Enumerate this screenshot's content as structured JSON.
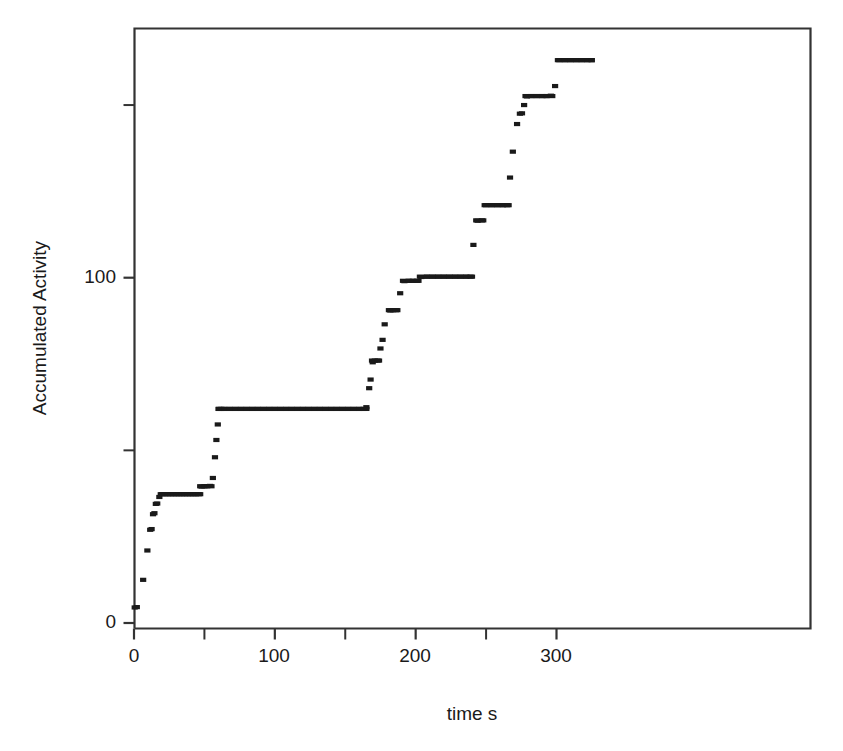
{
  "chart_data": {
    "type": "scatter",
    "title": "",
    "subtitle": "",
    "xlabel": "time s",
    "ylabel": "Accumulated Activity",
    "xlim": [
      -4,
      338
    ],
    "ylim": [
      -3,
      176
    ],
    "grid": false,
    "legend": null,
    "marker": "small filled square",
    "marker_color": "#1a1a1a",
    "xticks_major": [
      0,
      100,
      200,
      300
    ],
    "xticks_major_labels": [
      "0",
      "100",
      "200",
      "300"
    ],
    "xticks_minor": [
      50,
      150,
      250
    ],
    "yticks_major": [
      0,
      100
    ],
    "yticks_major_labels": [
      "0",
      "100"
    ],
    "yticks_minor": [
      50,
      150
    ],
    "points": [
      [
        0.5,
        4.5
      ],
      [
        2.0,
        4.6
      ],
      [
        6.5,
        12.5
      ],
      [
        9.5,
        21.0
      ],
      [
        11.5,
        27.0
      ],
      [
        12.5,
        27.2
      ],
      [
        13.5,
        31.5
      ],
      [
        14.5,
        31.8
      ],
      [
        15.5,
        34.5
      ],
      [
        16.5,
        34.6
      ],
      [
        18.0,
        36.5
      ],
      [
        20.0,
        37.3
      ],
      [
        22.0,
        37.3
      ],
      [
        24.0,
        37.3
      ],
      [
        26.0,
        37.3
      ],
      [
        28.0,
        37.3
      ],
      [
        30.0,
        37.3
      ],
      [
        32.0,
        37.3
      ],
      [
        34.0,
        37.3
      ],
      [
        36.0,
        37.3
      ],
      [
        38.0,
        37.3
      ],
      [
        40.0,
        37.3
      ],
      [
        42.0,
        37.3
      ],
      [
        44.0,
        37.3
      ],
      [
        46.0,
        37.3
      ],
      [
        48.0,
        39.5
      ],
      [
        50.0,
        39.6
      ],
      [
        52.0,
        39.6
      ],
      [
        54.0,
        39.7
      ],
      [
        56.0,
        42.0
      ],
      [
        57.5,
        48.0
      ],
      [
        58.5,
        53.0
      ],
      [
        59.5,
        57.5
      ],
      [
        60.5,
        62.0
      ],
      [
        62.0,
        62.0
      ],
      [
        64.0,
        62.0
      ],
      [
        68.0,
        62.0
      ],
      [
        72.0,
        62.0
      ],
      [
        76.0,
        62.0
      ],
      [
        80.0,
        62.0
      ],
      [
        84.0,
        62.0
      ],
      [
        88.0,
        62.0
      ],
      [
        92.0,
        62.0
      ],
      [
        96.0,
        62.0
      ],
      [
        100.0,
        62.0
      ],
      [
        104.0,
        62.0
      ],
      [
        108.0,
        62.0
      ],
      [
        112.0,
        62.0
      ],
      [
        116.0,
        62.0
      ],
      [
        120.0,
        62.0
      ],
      [
        124.0,
        62.0
      ],
      [
        128.0,
        62.0
      ],
      [
        132.0,
        62.0
      ],
      [
        136.0,
        62.0
      ],
      [
        140.0,
        62.0
      ],
      [
        144.0,
        62.0
      ],
      [
        148.0,
        62.0
      ],
      [
        152.0,
        62.0
      ],
      [
        156.0,
        62.0
      ],
      [
        160.0,
        62.0
      ],
      [
        163.0,
        62.0
      ],
      [
        165.0,
        62.5
      ],
      [
        167.0,
        68.0
      ],
      [
        168.0,
        70.5
      ],
      [
        169.5,
        75.5
      ],
      [
        171.0,
        76.0
      ],
      [
        173.0,
        76.0
      ],
      [
        175.0,
        79.5
      ],
      [
        176.5,
        82.0
      ],
      [
        178.0,
        86.5
      ],
      [
        182.0,
        90.5
      ],
      [
        184.0,
        90.6
      ],
      [
        186.0,
        90.6
      ],
      [
        189.0,
        95.5
      ],
      [
        192.0,
        99.0
      ],
      [
        195.0,
        99.1
      ],
      [
        198.0,
        99.1
      ],
      [
        201.0,
        99.1
      ],
      [
        204.0,
        100.2
      ],
      [
        208.0,
        100.3
      ],
      [
        212.0,
        100.3
      ],
      [
        216.0,
        100.3
      ],
      [
        220.0,
        100.3
      ],
      [
        224.0,
        100.3
      ],
      [
        228.0,
        100.3
      ],
      [
        232.0,
        100.3
      ],
      [
        236.0,
        100.3
      ],
      [
        239.0,
        100.3
      ],
      [
        241.0,
        109.5
      ],
      [
        244.0,
        116.5
      ],
      [
        247.0,
        116.6
      ],
      [
        250.0,
        121.0
      ],
      [
        254.0,
        121.0
      ],
      [
        258.0,
        121.0
      ],
      [
        262.0,
        121.0
      ],
      [
        265.0,
        121.0
      ],
      [
        267.0,
        129.0
      ],
      [
        269.0,
        136.5
      ],
      [
        272.0,
        144.5
      ],
      [
        274.0,
        147.5
      ],
      [
        275.5,
        147.6
      ],
      [
        277.0,
        150.0
      ],
      [
        279.0,
        152.5
      ],
      [
        282.0,
        152.6
      ],
      [
        286.0,
        152.6
      ],
      [
        290.0,
        152.6
      ],
      [
        293.0,
        152.6
      ],
      [
        296.0,
        152.7
      ],
      [
        299.0,
        155.5
      ],
      [
        302.0,
        163.0
      ],
      [
        306.0,
        163.0
      ],
      [
        310.0,
        163.0
      ],
      [
        314.0,
        163.0
      ],
      [
        318.0,
        163.0
      ],
      [
        322.0,
        163.0
      ],
      [
        325.0,
        163.0
      ]
    ],
    "plateaus": [
      {
        "y": 37.3,
        "x_start": 19,
        "x_end": 47
      },
      {
        "y": 39.6,
        "x_start": 47,
        "x_end": 55
      },
      {
        "y": 62.0,
        "x_start": 60,
        "x_end": 165
      },
      {
        "y": 76.0,
        "x_start": 169,
        "x_end": 174
      },
      {
        "y": 90.6,
        "x_start": 181,
        "x_end": 187
      },
      {
        "y": 99.1,
        "x_start": 191,
        "x_end": 202
      },
      {
        "y": 100.3,
        "x_start": 203,
        "x_end": 240
      },
      {
        "y": 116.6,
        "x_start": 243,
        "x_end": 248
      },
      {
        "y": 121.0,
        "x_start": 249,
        "x_end": 266
      },
      {
        "y": 152.6,
        "x_start": 278,
        "x_end": 297
      },
      {
        "y": 163.0,
        "x_start": 301,
        "x_end": 325
      }
    ]
  },
  "axes": {
    "ylabel": "Accumulated Activity",
    "xlabel": "time s",
    "y_tick_labels": [
      "100",
      "0"
    ],
    "x_tick_labels": [
      "0",
      "100",
      "200",
      "300"
    ]
  },
  "colors": {
    "marker": "#1a1a1a",
    "axis": "#333333",
    "background": "#ffffff"
  }
}
